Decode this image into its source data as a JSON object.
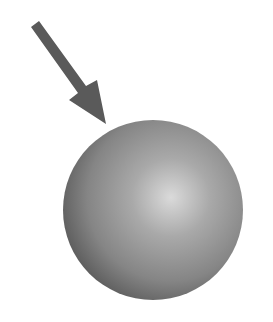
{
  "figure": {
    "arrow": {
      "color": "#5a5a5a",
      "direction": "down-right"
    },
    "sphere": {
      "highlight_color": "#d8d8d8",
      "mid_color": "#9a9a9a",
      "edge_color": "#5e5e5e"
    },
    "background": "#ffffff"
  }
}
